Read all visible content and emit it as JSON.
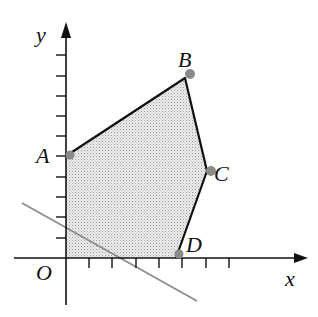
{
  "diagram": {
    "type": "linear-programming-feasible-region",
    "axes": {
      "x_label": "x",
      "y_label": "y",
      "origin_label": "O",
      "x_ticks": [
        1,
        2,
        3,
        4,
        5,
        6,
        7
      ],
      "y_ticks": [
        1,
        2,
        3,
        4,
        5,
        6,
        7,
        8,
        9,
        10
      ]
    },
    "vertices": [
      {
        "label": "A",
        "x": 0,
        "y": 5
      },
      {
        "label": "B",
        "x": 5.1,
        "y": 8.8
      },
      {
        "label": "C",
        "x": 6.0,
        "y": 4.3
      },
      {
        "label": "D",
        "x": 4.7,
        "y": 0
      }
    ],
    "region_fill": "#d6d6d6",
    "region_stroke": "#111111",
    "vertex_dot_color": "#8a8a8a",
    "objective_line": {
      "color": "#8c8c8c",
      "from": {
        "x": -1.9,
        "y": 2.7
      },
      "to": {
        "x": 5.6,
        "y": -2.1
      }
    }
  }
}
